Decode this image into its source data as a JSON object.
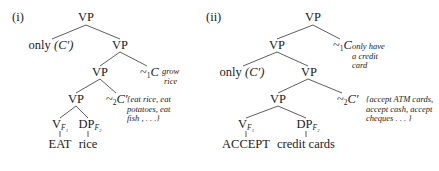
{
  "figure": {
    "tree_i": {
      "label": "(i)",
      "root": "VP",
      "only_word": "only",
      "only_arg": "(C′)",
      "vp_right": "VP",
      "vp_mid": "VP",
      "squiggle1": "~",
      "squiggle1_sub": "1",
      "squiggle1_var": "C",
      "squiggle1_ann": [
        "grow",
        "rice"
      ],
      "vp_low": "VP",
      "squiggle2": "~",
      "squiggle2_sub": "2",
      "squiggle2_var": "C′",
      "squiggle2_ann": [
        "{eat rice, eat",
        "potatoes, eat",
        "fish , . . .}"
      ],
      "v_node": "V",
      "v_sub": "F₁",
      "dp_node": "DP",
      "dp_sub": "F₂",
      "v_leaf": "EAT",
      "dp_leaf": "rice"
    },
    "tree_ii": {
      "label": "(ii)",
      "root": "VP",
      "vp_left": "VP",
      "squiggle1": "~",
      "squiggle1_sub": "1",
      "squiggle1_var": "C",
      "squiggle1_ann": [
        "only have",
        "a credit",
        "card"
      ],
      "only_word": "only",
      "only_arg": "(C′)",
      "vp_mid": "VP",
      "vp_low": "VP",
      "squiggle2": "~",
      "squiggle2_sub": "2",
      "squiggle2_var": "C′",
      "squiggle2_ann": [
        "{accept ATM cards,",
        "accept cash, accept",
        "cheques . . . }"
      ],
      "v_node": "V",
      "v_sub": "F₁",
      "dp_node": "DP",
      "dp_sub": "F₂",
      "v_leaf": "ACCEPT",
      "dp_leaf": "credit cards"
    },
    "line_color": "#333333",
    "text_color": "#222222"
  }
}
